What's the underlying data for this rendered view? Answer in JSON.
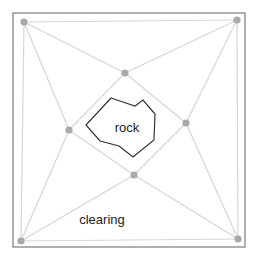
{
  "diagram": {
    "type": "triangulation",
    "frame": {
      "x": 13,
      "y": 13,
      "width": 232,
      "height": 234,
      "stroke": "#7a7a7a"
    },
    "node_color": "#a9a9a9",
    "edge_color": "#d6d6d6",
    "obstacle_color": "#333333",
    "nodes": [
      {
        "id": "tl",
        "x": 24,
        "y": 22
      },
      {
        "id": "tr",
        "x": 237,
        "y": 20
      },
      {
        "id": "bl",
        "x": 21,
        "y": 241
      },
      {
        "id": "br",
        "x": 238,
        "y": 239
      },
      {
        "id": "top",
        "x": 125,
        "y": 73
      },
      {
        "id": "left",
        "x": 69,
        "y": 130
      },
      {
        "id": "right",
        "x": 186,
        "y": 123
      },
      {
        "id": "bottom",
        "x": 134,
        "y": 175
      }
    ],
    "edges": [
      [
        "tl",
        "tr"
      ],
      [
        "tr",
        "br"
      ],
      [
        "br",
        "bl"
      ],
      [
        "bl",
        "tl"
      ],
      [
        "tl",
        "top"
      ],
      [
        "tr",
        "top"
      ],
      [
        "tl",
        "left"
      ],
      [
        "bl",
        "left"
      ],
      [
        "tr",
        "right"
      ],
      [
        "br",
        "right"
      ],
      [
        "bl",
        "bottom"
      ],
      [
        "br",
        "bottom"
      ],
      [
        "top",
        "left"
      ],
      [
        "top",
        "right"
      ],
      [
        "left",
        "bottom"
      ],
      [
        "right",
        "bottom"
      ]
    ],
    "obstacle": {
      "label": "rock",
      "points": [
        [
          111,
          98
        ],
        [
          135,
          106
        ],
        [
          143,
          100
        ],
        [
          155,
          114
        ],
        [
          154,
          140
        ],
        [
          133,
          157
        ],
        [
          119,
          146
        ],
        [
          100,
          141
        ],
        [
          86,
          125
        ]
      ]
    },
    "labels": {
      "rock": {
        "text": "rock",
        "x": 127,
        "y": 127
      },
      "clearing": {
        "text": "clearing",
        "x": 102,
        "y": 219
      }
    }
  }
}
